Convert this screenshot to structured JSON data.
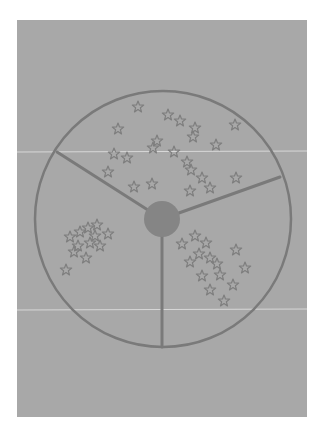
{
  "figure": {
    "colors": {
      "page_background": "#ffffff",
      "plate_background": "#a8a8a8",
      "stroke": "#7a7a7a",
      "hub_fill": "#858585",
      "star_stroke": "#7e7e7e",
      "scan_line": "#d8d8d8"
    },
    "circle": {
      "cx": 163,
      "cy": 219,
      "r": 128
    },
    "hub": {
      "cx": 162,
      "cy": 219,
      "r": 18
    },
    "spokes": [
      {
        "name": "upper-left",
        "x2": 57,
        "y2": 152
      },
      {
        "name": "right",
        "x2": 280,
        "y2": 177
      },
      {
        "name": "bottom",
        "x2": 162,
        "y2": 347
      }
    ],
    "sectors": [
      {
        "name": "top",
        "star_count": 22,
        "stars": [
          [
            138,
            107
          ],
          [
            168,
            115
          ],
          [
            180,
            121
          ],
          [
            195,
            128
          ],
          [
            118,
            129
          ],
          [
            235,
            125
          ],
          [
            157,
            141
          ],
          [
            153,
            148
          ],
          [
            127,
            158
          ],
          [
            108,
            172
          ],
          [
            187,
            162
          ],
          [
            191,
            170
          ],
          [
            202,
            178
          ],
          [
            236,
            178
          ],
          [
            134,
            187
          ],
          [
            152,
            184
          ],
          [
            190,
            191
          ],
          [
            114,
            154
          ],
          [
            174,
            152
          ],
          [
            193,
            137
          ],
          [
            216,
            145
          ],
          [
            210,
            188
          ]
        ]
      },
      {
        "name": "lower-left",
        "star_count": 12,
        "stars": [
          [
            70,
            237
          ],
          [
            80,
            232
          ],
          [
            88,
            228
          ],
          [
            97,
            225
          ],
          [
            108,
            234
          ],
          [
            78,
            246
          ],
          [
            90,
            243
          ],
          [
            100,
            246
          ],
          [
            86,
            258
          ],
          [
            66,
            270
          ],
          [
            74,
            252
          ],
          [
            95,
            236
          ]
        ]
      },
      {
        "name": "lower-right",
        "star_count": 14,
        "stars": [
          [
            182,
            244
          ],
          [
            195,
            236
          ],
          [
            206,
            243
          ],
          [
            199,
            254
          ],
          [
            210,
            258
          ],
          [
            236,
            250
          ],
          [
            217,
            264
          ],
          [
            245,
            268
          ],
          [
            220,
            275
          ],
          [
            202,
            276
          ],
          [
            233,
            285
          ],
          [
            210,
            290
          ],
          [
            224,
            301
          ],
          [
            190,
            262
          ]
        ]
      }
    ],
    "scan_lines": [
      {
        "y": 152
      },
      {
        "y": 310
      }
    ]
  }
}
